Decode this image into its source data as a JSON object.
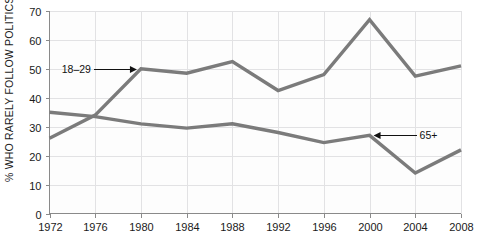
{
  "chart_data": {
    "type": "line",
    "title": "",
    "subtitle": "",
    "xlabel": "",
    "ylabel": "% WHO RARELY FOLLOW POLITICS",
    "x": [
      1972,
      1976,
      1980,
      1984,
      1988,
      1992,
      1996,
      2000,
      2004,
      2008
    ],
    "xticklabels": [
      "1972",
      "1976",
      "1980",
      "1984",
      "1988",
      "1992",
      "1996",
      "2000",
      "2004",
      "2008"
    ],
    "yticklabels": [
      "0",
      "10",
      "20",
      "30",
      "40",
      "50",
      "60",
      "70"
    ],
    "yticks": [
      0,
      10,
      20,
      30,
      40,
      50,
      60,
      70
    ],
    "xlim": [
      1972,
      2008
    ],
    "ylim": [
      0,
      70
    ],
    "grid": "both",
    "legend_position": "inline-annotations",
    "series": [
      {
        "name": "18–29",
        "color": "#7b7b7b",
        "values": [
          26,
          34,
          50,
          48.5,
          52.5,
          42.5,
          48,
          67,
          47.5,
          51
        ]
      },
      {
        "name": "65+",
        "color": "#7b7b7b",
        "values": [
          35,
          33.5,
          31,
          29.5,
          31,
          28,
          24.5,
          27,
          14,
          22
        ]
      }
    ],
    "annotations": [
      {
        "text": "18–29",
        "target_x": 1980,
        "target_y": 50,
        "direction": "right"
      },
      {
        "text": "65+",
        "target_x": 2000,
        "target_y": 27,
        "direction": "left"
      }
    ]
  },
  "colors": {
    "line": "#7b7b7b",
    "grid": "#e2e2e4",
    "axis": "#8a8a8a",
    "text": "#1a1a1a",
    "background": "#ffffff"
  }
}
